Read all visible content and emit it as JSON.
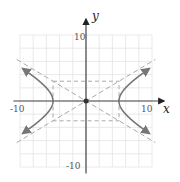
{
  "diagram": {
    "type": "hyperbola-graph",
    "equation": "x^2/25 - y^2/9 = 1",
    "axes": {
      "x_label": "x",
      "y_label": "y",
      "x_tick_labels": [
        "-10",
        "10"
      ],
      "y_tick_labels": [
        "10",
        "-10"
      ],
      "range": [
        -10,
        10
      ],
      "grid_step": 2
    },
    "center": [
      0,
      0
    ],
    "a": 5,
    "b": 3,
    "asymptotes": [
      "y = 3/5 x",
      "y = -3/5 x"
    ],
    "fundamental_rectangle": {
      "x": [
        -5,
        5
      ],
      "y": [
        -3,
        3
      ]
    },
    "colors": {
      "grid": "#e4e4e4",
      "axis": "#444444",
      "curve": "#777777",
      "dashed": "#aaaaaa"
    }
  }
}
